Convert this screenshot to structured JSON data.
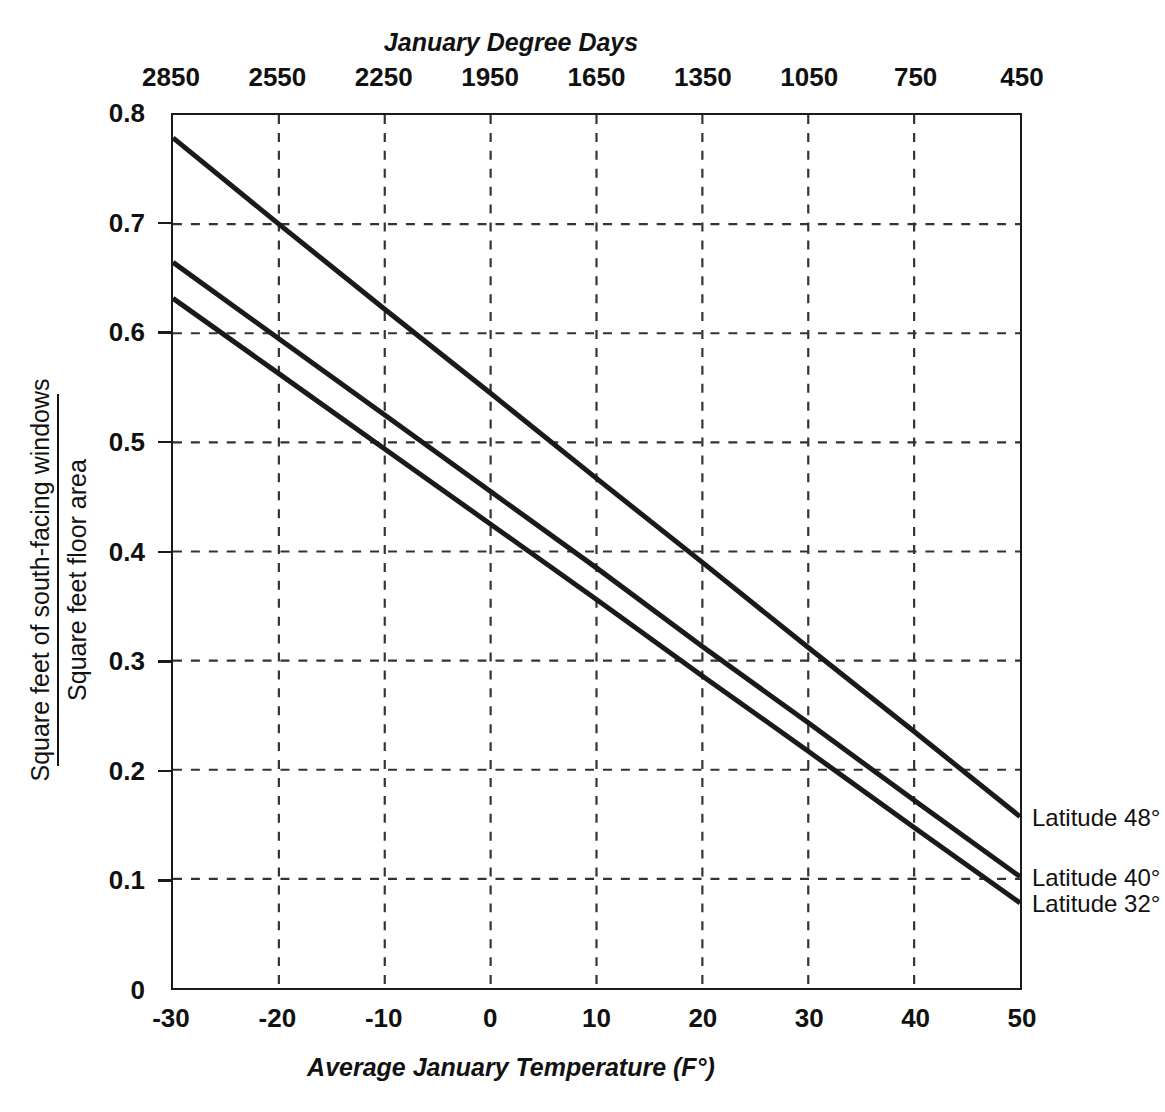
{
  "chart_data": {
    "type": "line",
    "title": "",
    "xlabel": "Average January Temperature (F°)",
    "ylabel_numerator": "Square feet of south-facing windows",
    "ylabel_denominator": "Square feet floor area",
    "top_axis_label": "January Degree Days",
    "xlim": [
      -30,
      50
    ],
    "ylim": [
      0,
      0.8
    ],
    "grid": true,
    "legend_position": "right-inline",
    "x_ticks": [
      -30,
      -20,
      -10,
      0,
      10,
      20,
      30,
      40,
      50
    ],
    "x_tick_labels": [
      "-30",
      "-20",
      "-10",
      "0",
      "10",
      "20",
      "30",
      "40",
      "50"
    ],
    "top_x_ticks": [
      -30,
      -20,
      -10,
      0,
      10,
      20,
      30,
      40,
      50
    ],
    "top_x_tick_labels": [
      "2850",
      "2550",
      "2250",
      "1950",
      "1650",
      "1350",
      "1050",
      "750",
      "450"
    ],
    "y_ticks": [
      0,
      0.1,
      0.2,
      0.3,
      0.4,
      0.5,
      0.6,
      0.7,
      0.8
    ],
    "y_tick_labels": [
      "0",
      "0.1",
      "0.2",
      "0.3",
      "0.4",
      "0.5",
      "0.6",
      "0.7",
      "0.8"
    ],
    "line_color": "#1a1a1a",
    "grid_color": "#333333",
    "series": [
      {
        "name": "Latitude 48°",
        "label": "Latitude 48°",
        "x": [
          -30,
          -20,
          -10,
          0,
          10,
          20,
          30,
          40,
          50
        ],
        "values": [
          0.779,
          0.7,
          0.622,
          0.545,
          0.467,
          0.39,
          0.312,
          0.235,
          0.157
        ]
      },
      {
        "name": "Latitude 40°",
        "label": "Latitude 40°",
        "x": [
          -30,
          -20,
          -10,
          0,
          10,
          20,
          30,
          40,
          50
        ],
        "values": [
          0.665,
          0.595,
          0.525,
          0.455,
          0.385,
          0.313,
          0.243,
          0.172,
          0.102
        ]
      },
      {
        "name": "Latitude 32°",
        "label": "Latitude 32°",
        "x": [
          -30,
          -20,
          -10,
          0,
          10,
          20,
          30,
          40,
          50
        ],
        "values": [
          0.632,
          0.563,
          0.494,
          0.425,
          0.356,
          0.286,
          0.217,
          0.147,
          0.078
        ]
      }
    ]
  }
}
